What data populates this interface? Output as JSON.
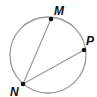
{
  "diagram": {
    "type": "inscribed-angle",
    "circle": {
      "cx": 48,
      "cy": 55,
      "r": 38,
      "stroke": "#9a9a9a"
    },
    "points": [
      {
        "id": "M",
        "label": "M",
        "x": 51,
        "y": 19,
        "label_x": 54,
        "label_y": 15
      },
      {
        "id": "P",
        "label": "P",
        "x": 84,
        "y": 50,
        "label_x": 86,
        "label_y": 45
      },
      {
        "id": "N",
        "label": "N",
        "x": 23,
        "y": 84,
        "label_x": 10,
        "label_y": 96
      }
    ],
    "chords": [
      {
        "from": "N",
        "to": "M"
      },
      {
        "from": "N",
        "to": "P"
      }
    ],
    "colors": {
      "line": "#9a9a9a",
      "point": "#111111",
      "label": "#111111"
    }
  }
}
